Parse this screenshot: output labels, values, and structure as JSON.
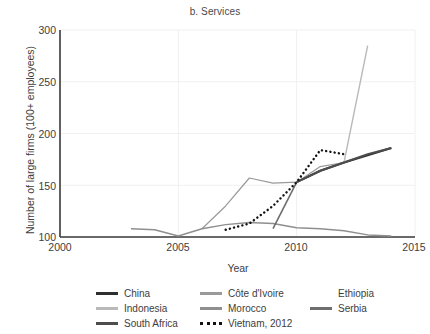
{
  "chart_data": {
    "type": "line",
    "title": "b. Services",
    "xlabel": "Year",
    "ylabel": "Number of large firms (100+ employees)",
    "xlim": [
      2000,
      2015
    ],
    "ylim": [
      100,
      300
    ],
    "xticks": [
      "2000",
      "2005",
      "2010",
      "2015"
    ],
    "yticks": [
      "100",
      "150",
      "200",
      "250",
      "300"
    ],
    "grid": true,
    "legend_position": "below",
    "series": [
      {
        "name": "China",
        "color": "#2e2e2e",
        "style": "solid",
        "width": 2.0,
        "points": [
          [
            2010,
            153
          ],
          [
            2011,
            164
          ],
          [
            2012,
            172
          ],
          [
            2013,
            179
          ],
          [
            2014,
            186
          ]
        ]
      },
      {
        "name": "Côte d'Ivoire",
        "color": "#9a9a9a",
        "style": "solid",
        "width": 1.2,
        "points": [
          [
            2006,
            108
          ],
          [
            2007,
            130
          ],
          [
            2008,
            157
          ],
          [
            2009,
            152
          ],
          [
            2010,
            153
          ],
          [
            2011,
            168
          ],
          [
            2012,
            172
          ]
        ]
      },
      {
        "name": "Ethiopia",
        "color": "#ffffff",
        "style": "solid",
        "width": 1.2,
        "points": []
      },
      {
        "name": "Indonesia",
        "color": "#b9b9b9",
        "style": "solid",
        "width": 1.4,
        "points": [
          [
            2012,
            172
          ],
          [
            2013,
            285
          ]
        ]
      },
      {
        "name": "Morocco",
        "color": "#8f8f8f",
        "style": "solid",
        "width": 1.4,
        "points": [
          [
            2003,
            108
          ],
          [
            2004,
            107
          ],
          [
            2005,
            101
          ],
          [
            2006,
            108
          ],
          [
            2007,
            112
          ],
          [
            2008,
            114
          ],
          [
            2009,
            113
          ],
          [
            2010,
            109
          ],
          [
            2011,
            108
          ],
          [
            2012,
            106
          ],
          [
            2013,
            102
          ],
          [
            2014,
            101
          ]
        ]
      },
      {
        "name": "Serbia",
        "color": "#6e6e6e",
        "style": "solid",
        "width": 1.6,
        "points": [
          [
            2009,
            108
          ],
          [
            2010,
            153
          ]
        ]
      },
      {
        "name": "South Africa",
        "color": "#4d4d4d",
        "style": "solid",
        "width": 2.0,
        "points": [
          [
            2010,
            153
          ],
          [
            2011,
            164
          ],
          [
            2012,
            172
          ],
          [
            2013,
            180
          ],
          [
            2014,
            186
          ]
        ]
      },
      {
        "name": "Vietnam, 2012",
        "color": "#111111",
        "style": "dotted",
        "width": 2.4,
        "points": [
          [
            2007,
            107
          ],
          [
            2008,
            113
          ],
          [
            2009,
            130
          ],
          [
            2010,
            153
          ],
          [
            2011,
            184
          ],
          [
            2012,
            180
          ]
        ]
      }
    ]
  },
  "legend": {
    "rows": [
      [
        {
          "label": "China",
          "swatch": "#2e2e2e",
          "style": "solid"
        },
        {
          "label": "Côte d'Ivoire",
          "swatch": "#9a9a9a",
          "style": "solid"
        },
        {
          "label": "Ethiopia",
          "swatch": "#ffffff",
          "style": "solid"
        }
      ],
      [
        {
          "label": "Indonesia",
          "swatch": "#b9b9b9",
          "style": "solid"
        },
        {
          "label": "Morocco",
          "swatch": "#8f8f8f",
          "style": "solid"
        },
        {
          "label": "Serbia",
          "swatch": "#6e6e6e",
          "style": "solid"
        }
      ],
      [
        {
          "label": "South Africa",
          "swatch": "#4d4d4d",
          "style": "solid"
        },
        {
          "label": "Vietnam, 2012",
          "swatch": "#111111",
          "style": "dotted"
        },
        {
          "label": "",
          "swatch": "none",
          "style": "none"
        }
      ]
    ]
  },
  "axes": {
    "spine_color": "#3a3a3a",
    "grid_color": "#f0f0f0"
  }
}
